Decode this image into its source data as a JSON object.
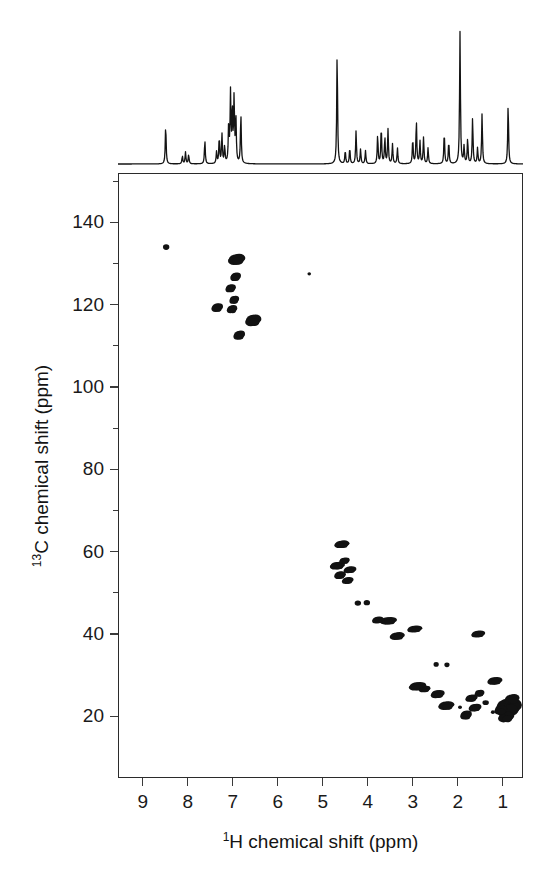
{
  "figure": {
    "kind": "2D NMR HSQC contour spectrum with 1D proton projection",
    "background_color": "#ffffff",
    "ink_color": "#1a1a1a"
  },
  "axes": {
    "x": {
      "label_prefix": "1",
      "label_text": "H chemical shift (ppm)",
      "ticks": [
        9,
        8,
        7,
        6,
        5,
        4,
        3,
        2,
        1
      ],
      "range": [
        9.55,
        0.55
      ],
      "direction": "reversed"
    },
    "y": {
      "label_prefix": "13",
      "label_text": "C chemical shift (ppm)",
      "ticks": [
        20,
        40,
        60,
        80,
        100,
        120,
        140
      ],
      "minor_ticks": [
        10,
        30,
        50,
        70,
        90,
        110,
        130,
        150
      ],
      "range": [
        5,
        152
      ],
      "direction": "reversed"
    }
  },
  "chart_data": {
    "type": "scatter",
    "title": "",
    "xlabel": "1H chemical shift (ppm)",
    "ylabel": "13C chemical shift (ppm)",
    "xlim": [
      9.55,
      0.55
    ],
    "ylim": [
      152,
      5
    ],
    "grid": false,
    "legend": "none",
    "series": [
      {
        "name": "HSQC cross peaks",
        "points": [
          {
            "x": 0.88,
            "y": 22.2,
            "rx": 11.5,
            "ry": 8.5,
            "intensity": "very-strong"
          },
          {
            "x": 0.93,
            "y": 19.8,
            "rx": 7.0,
            "ry": 5.0,
            "intensity": "strong"
          },
          {
            "x": 0.8,
            "y": 24.2,
            "rx": 6.5,
            "ry": 4.5,
            "intensity": "strong"
          },
          {
            "x": 1.05,
            "y": 21.5,
            "rx": 5.5,
            "ry": 4.0,
            "intensity": "medium"
          },
          {
            "x": 1.22,
            "y": 21.0,
            "rx": 2.0,
            "ry": 1.8,
            "intensity": "weak"
          },
          {
            "x": 1.62,
            "y": 22.1,
            "rx": 5.5,
            "ry": 3.6,
            "intensity": "medium"
          },
          {
            "x": 1.82,
            "y": 20.3,
            "rx": 5.0,
            "ry": 4.2,
            "intensity": "medium"
          },
          {
            "x": 1.7,
            "y": 24.4,
            "rx": 5.2,
            "ry": 3.4,
            "intensity": "medium"
          },
          {
            "x": 1.52,
            "y": 25.6,
            "rx": 4.2,
            "ry": 3.2,
            "intensity": "medium"
          },
          {
            "x": 1.95,
            "y": 22.2,
            "rx": 2.0,
            "ry": 1.8,
            "intensity": "weak"
          },
          {
            "x": 1.38,
            "y": 23.3,
            "rx": 3.2,
            "ry": 2.4,
            "intensity": "weak"
          },
          {
            "x": 1.18,
            "y": 28.6,
            "rx": 6.5,
            "ry": 3.6,
            "intensity": "strong"
          },
          {
            "x": 2.26,
            "y": 22.6,
            "rx": 7.0,
            "ry": 4.0,
            "intensity": "strong"
          },
          {
            "x": 2.45,
            "y": 25.4,
            "rx": 6.0,
            "ry": 3.8,
            "intensity": "medium"
          },
          {
            "x": 2.9,
            "y": 27.3,
            "rx": 7.5,
            "ry": 4.0,
            "intensity": "strong"
          },
          {
            "x": 2.74,
            "y": 26.6,
            "rx": 5.0,
            "ry": 3.0,
            "intensity": "medium"
          },
          {
            "x": 2.48,
            "y": 32.6,
            "rx": 2.6,
            "ry": 2.4,
            "intensity": "weak"
          },
          {
            "x": 2.24,
            "y": 32.5,
            "rx": 2.6,
            "ry": 2.4,
            "intensity": "weak"
          },
          {
            "x": 1.55,
            "y": 40.0,
            "rx": 6.0,
            "ry": 3.2,
            "intensity": "medium"
          },
          {
            "x": 2.96,
            "y": 41.2,
            "rx": 6.5,
            "ry": 3.2,
            "intensity": "medium"
          },
          {
            "x": 3.35,
            "y": 39.5,
            "rx": 6.5,
            "ry": 3.6,
            "intensity": "medium"
          },
          {
            "x": 3.55,
            "y": 43.2,
            "rx": 7.5,
            "ry": 3.6,
            "intensity": "strong"
          },
          {
            "x": 3.78,
            "y": 43.4,
            "rx": 5.0,
            "ry": 3.2,
            "intensity": "medium"
          },
          {
            "x": 4.02,
            "y": 47.6,
            "rx": 3.2,
            "ry": 2.6,
            "intensity": "weak"
          },
          {
            "x": 4.22,
            "y": 47.5,
            "rx": 3.2,
            "ry": 2.6,
            "intensity": "weak"
          },
          {
            "x": 4.45,
            "y": 53.0,
            "rx": 5.0,
            "ry": 3.2,
            "intensity": "medium"
          },
          {
            "x": 4.62,
            "y": 54.3,
            "rx": 5.0,
            "ry": 3.6,
            "intensity": "medium"
          },
          {
            "x": 4.4,
            "y": 55.6,
            "rx": 5.5,
            "ry": 3.2,
            "intensity": "medium"
          },
          {
            "x": 4.68,
            "y": 56.6,
            "rx": 6.5,
            "ry": 3.6,
            "intensity": "strong"
          },
          {
            "x": 4.52,
            "y": 57.8,
            "rx": 4.5,
            "ry": 3.0,
            "intensity": "medium"
          },
          {
            "x": 4.58,
            "y": 61.8,
            "rx": 6.5,
            "ry": 3.6,
            "intensity": "strong"
          },
          {
            "x": 6.86,
            "y": 112.6,
            "rx": 5.0,
            "ry": 4.2,
            "intensity": "medium"
          },
          {
            "x": 6.55,
            "y": 116.2,
            "rx": 7.0,
            "ry": 5.5,
            "intensity": "strong"
          },
          {
            "x": 7.35,
            "y": 119.3,
            "rx": 5.0,
            "ry": 4.0,
            "intensity": "medium"
          },
          {
            "x": 7.02,
            "y": 118.9,
            "rx": 4.5,
            "ry": 3.8,
            "intensity": "medium"
          },
          {
            "x": 6.97,
            "y": 121.2,
            "rx": 4.2,
            "ry": 3.8,
            "intensity": "medium"
          },
          {
            "x": 7.05,
            "y": 124.0,
            "rx": 4.5,
            "ry": 3.8,
            "intensity": "medium"
          },
          {
            "x": 6.94,
            "y": 126.8,
            "rx": 4.6,
            "ry": 4.0,
            "intensity": "medium"
          },
          {
            "x": 6.92,
            "y": 131.0,
            "rx": 7.5,
            "ry": 5.2,
            "intensity": "strong"
          },
          {
            "x": 5.3,
            "y": 127.5,
            "rx": 1.8,
            "ry": 1.6,
            "intensity": "very-weak"
          },
          {
            "x": 8.48,
            "y": 134.0,
            "rx": 3.2,
            "ry": 2.8,
            "intensity": "weak"
          }
        ]
      }
    ],
    "projection_1d": {
      "name": "1H spectrum projection",
      "axis": "x",
      "baseline_ppm_range": [
        9.55,
        0.55
      ],
      "peaks": [
        {
          "ppm": 8.49,
          "height": 0.3
        },
        {
          "ppm": 8.12,
          "height": 0.06
        },
        {
          "ppm": 8.05,
          "height": 0.09
        },
        {
          "ppm": 7.98,
          "height": 0.07
        },
        {
          "ppm": 7.62,
          "height": 0.18
        },
        {
          "ppm": 7.36,
          "height": 0.09
        },
        {
          "ppm": 7.3,
          "height": 0.2
        },
        {
          "ppm": 7.24,
          "height": 0.22
        },
        {
          "ppm": 7.18,
          "height": 0.13
        },
        {
          "ppm": 7.09,
          "height": 0.3
        },
        {
          "ppm": 7.05,
          "height": 0.52
        },
        {
          "ppm": 7.01,
          "height": 0.41
        },
        {
          "ppm": 6.97,
          "height": 0.49
        },
        {
          "ppm": 6.93,
          "height": 0.33
        },
        {
          "ppm": 6.82,
          "height": 0.38
        },
        {
          "ppm": 4.68,
          "height": 0.86
        },
        {
          "ppm": 4.5,
          "height": 0.1
        },
        {
          "ppm": 4.4,
          "height": 0.12
        },
        {
          "ppm": 4.26,
          "height": 0.25
        },
        {
          "ppm": 4.16,
          "height": 0.11
        },
        {
          "ppm": 4.05,
          "height": 0.1
        },
        {
          "ppm": 3.78,
          "height": 0.22
        },
        {
          "ppm": 3.7,
          "height": 0.28
        },
        {
          "ppm": 3.62,
          "height": 0.2
        },
        {
          "ppm": 3.55,
          "height": 0.26
        },
        {
          "ppm": 3.45,
          "height": 0.15
        },
        {
          "ppm": 3.34,
          "height": 0.12
        },
        {
          "ppm": 3.0,
          "height": 0.19
        },
        {
          "ppm": 2.92,
          "height": 0.33
        },
        {
          "ppm": 2.84,
          "height": 0.17
        },
        {
          "ppm": 2.76,
          "height": 0.2
        },
        {
          "ppm": 2.66,
          "height": 0.12
        },
        {
          "ppm": 2.3,
          "height": 0.24
        },
        {
          "ppm": 2.2,
          "height": 0.17
        },
        {
          "ppm": 1.95,
          "height": 1.0
        },
        {
          "ppm": 1.86,
          "height": 0.13
        },
        {
          "ppm": 1.78,
          "height": 0.19
        },
        {
          "ppm": 1.67,
          "height": 0.35
        },
        {
          "ppm": 1.56,
          "height": 0.12
        },
        {
          "ppm": 1.46,
          "height": 0.38
        },
        {
          "ppm": 0.88,
          "height": 0.46
        }
      ]
    }
  }
}
